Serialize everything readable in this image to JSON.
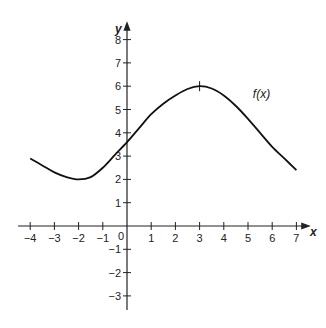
{
  "chart_data": {
    "type": "line",
    "title": "",
    "xlabel": "x",
    "ylabel": "y",
    "xlim": [
      -4,
      7
    ],
    "ylim": [
      -3,
      8
    ],
    "grid": false,
    "x_ticks": [
      -4,
      -3,
      -2,
      -1,
      0,
      1,
      2,
      3,
      4,
      5,
      6,
      7
    ],
    "y_ticks": [
      -3,
      -2,
      -1,
      1,
      2,
      3,
      4,
      5,
      6,
      7,
      8
    ],
    "series": [
      {
        "name": "f(x)",
        "x": [
          -4,
          -3.5,
          -3,
          -2.5,
          -2,
          -1.5,
          -1,
          -0.5,
          0,
          0.5,
          1,
          1.5,
          2,
          2.5,
          3,
          3.5,
          4,
          4.5,
          5,
          5.5,
          6,
          6.5,
          7
        ],
        "y": [
          2.9,
          2.6,
          2.3,
          2.1,
          2.0,
          2.1,
          2.5,
          3.05,
          3.6,
          4.2,
          4.8,
          5.25,
          5.6,
          5.88,
          6.0,
          5.9,
          5.6,
          5.15,
          4.6,
          4.0,
          3.4,
          2.9,
          2.4
        ]
      }
    ],
    "annotations": [
      {
        "text": "f(x)",
        "x": 5.2,
        "y": 5.5
      },
      {
        "text": "maximum tick mark",
        "x": 3,
        "y": 6
      }
    ],
    "origin_label": "0"
  }
}
